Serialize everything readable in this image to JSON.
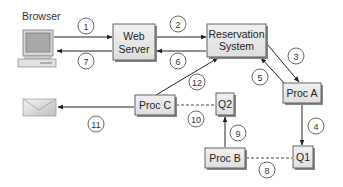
{
  "diagram": {
    "browser_label": "Browser",
    "nodes": {
      "web_server": [
        "Web",
        "Server"
      ],
      "reservation_system": [
        "Reservation",
        "System"
      ],
      "proc_a": "Proc A",
      "proc_b": "Proc B",
      "proc_c": "Proc C",
      "q1": "Q1",
      "q2": "Q2"
    },
    "steps": {
      "s1": "1",
      "s2": "2",
      "s3": "3",
      "s4": "4",
      "s5": "5",
      "s6": "6",
      "s7": "7",
      "s8": "8",
      "s9": "9",
      "s10": "10",
      "s11": "11",
      "s12": "12"
    },
    "icons": {
      "browser": "computer-icon",
      "email": "envelope-icon"
    }
  }
}
